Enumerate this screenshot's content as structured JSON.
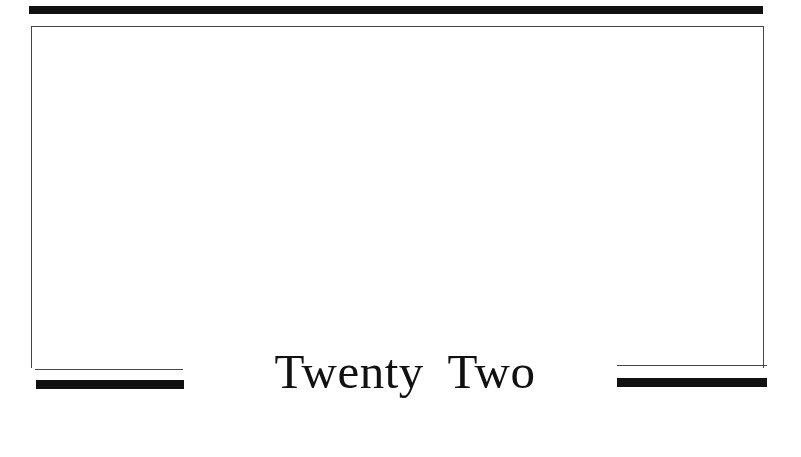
{
  "page": {
    "chapter_title": "Twenty Two"
  },
  "colors": {
    "ink": "#111111",
    "rule": "#444444",
    "paper": "#ffffff"
  }
}
